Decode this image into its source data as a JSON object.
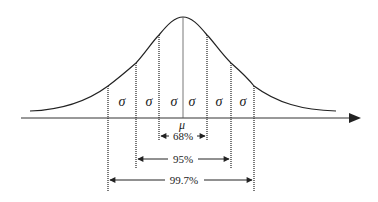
{
  "diagram": {
    "mean_label": "μ",
    "sigma_label": "σ",
    "sigma_labels": [
      "σ",
      "σ",
      "σ",
      "σ",
      "σ",
      "σ"
    ],
    "intervals": [
      {
        "label": "68%",
        "range": "μ ± 1σ"
      },
      {
        "label": "95%",
        "range": "μ ± 2σ"
      },
      {
        "label": "99.7%",
        "range": "μ ± 3σ"
      }
    ],
    "colors": {
      "line": "#222222",
      "background": "#ffffff"
    }
  }
}
